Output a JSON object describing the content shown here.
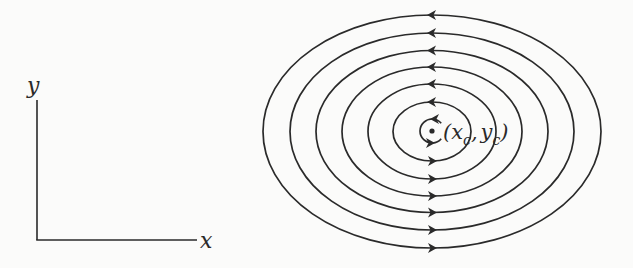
{
  "colors": {
    "background": "#fbfbfa",
    "ink": "#2a2a2a"
  },
  "axes": {
    "x_label": "x",
    "y_label": "y"
  },
  "center_point": {
    "label_open": "(",
    "x_symbol": "x",
    "x_subscript": "c",
    "separator": ",",
    "y_symbol": "y",
    "y_subscript": "c",
    "label_close": ")"
  },
  "streamlines": {
    "count": 6,
    "direction": "counterclockwise",
    "description": "Concentric elliptical streamlines around a vortex center, arrows pointing left on top and right on bottom"
  },
  "inner_curl": {
    "direction": "counterclockwise",
    "description": "Small circular curl around the center point"
  }
}
